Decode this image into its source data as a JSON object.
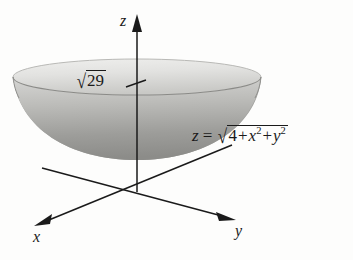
{
  "figure": {
    "surface_type": "bowl",
    "background_color": "#fdfdfc",
    "ink_color": "#1a1a1a",
    "surface_colors": {
      "top_face_light": "#e8e8e6",
      "top_face_mid": "#cfcfcc",
      "inner_bowl_light": "#cfcfcd",
      "inner_bowl_dark": "#8f8f8d",
      "outer_bowl": "#a9a9a6",
      "rim_edge": "#6e6e6b"
    }
  },
  "axes": {
    "z": {
      "label": "z",
      "direction": "up",
      "arrow": true
    },
    "y": {
      "label": "y",
      "direction": "down-right",
      "arrow": true
    },
    "x": {
      "label": "x",
      "direction": "down-left",
      "arrow": true
    }
  },
  "annotations": {
    "tick_value": {
      "radical_sign": "√",
      "radicand": "29",
      "full_text": "√29",
      "axis": "z",
      "has_tick_mark": true
    },
    "equation": {
      "lhs": "z",
      "equals": "=",
      "radical_sign": "√",
      "term_constant": "4",
      "op1": "+",
      "term_x_base": "x",
      "term_x_exp": "2",
      "op2": "+",
      "term_y_base": "y",
      "term_y_exp": "2",
      "full_text": "z = √(4 + x² + y²)"
    }
  }
}
